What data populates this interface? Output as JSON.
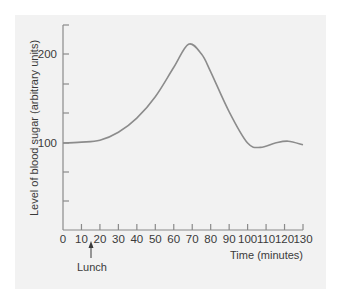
{
  "chart_data": {
    "type": "line",
    "title": "",
    "xlabel": "Time (minutes)",
    "ylabel": "Level of blood sugar (arbitrary units)",
    "xlim": [
      0,
      130
    ],
    "ylim": [
      -30,
      220
    ],
    "x_ticks": [
      0,
      10,
      20,
      30,
      40,
      50,
      60,
      70,
      80,
      90,
      100,
      110,
      120,
      130
    ],
    "y_tick_labels": [
      {
        "value": 100,
        "label": "100"
      },
      {
        "value": 200,
        "label": "200"
      }
    ],
    "grid": false,
    "series": [
      {
        "name": "Blood sugar",
        "x": [
          0,
          10,
          20,
          30,
          40,
          50,
          60,
          68,
          75,
          80,
          90,
          100,
          107,
          115,
          122,
          130
        ],
        "values": [
          100,
          101,
          103,
          112,
          128,
          152,
          185,
          211,
          200,
          180,
          135,
          100,
          95,
          100,
          102,
          98
        ]
      }
    ],
    "annotations": [
      {
        "text": "Lunch",
        "x": 15,
        "type": "arrow-up"
      }
    ]
  },
  "labels": {
    "ylabel": "Level of blood sugar (arbitrary units)",
    "xlabel": "Time (minutes)",
    "lunch": "Lunch",
    "y100": "100",
    "y200": "200"
  },
  "colors": {
    "panel": "#f2f2f2",
    "axis": "#8a8a8a",
    "curve": "#8c8c8c",
    "text": "#3a3a3a"
  }
}
